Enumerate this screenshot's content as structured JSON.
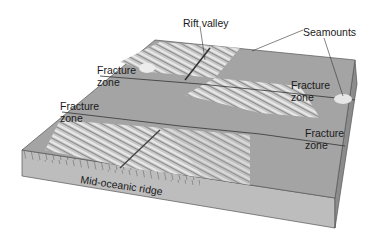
{
  "figure": {
    "type": "block-diagram",
    "colors": {
      "top_surface": "#a8a8a8",
      "ridge_texture": "#d8d8d8",
      "front_face": "#bdbdbd",
      "side_face": "#8c8c8c",
      "label_text": "#1a1a1a",
      "leader_line": "#333333"
    }
  },
  "labels": {
    "rift_valley": "Rift valley",
    "seamounts": "Seamounts",
    "fracture_zone_1_line1": "Fracture",
    "fracture_zone_1_line2": "zone",
    "fracture_zone_2_line1": "Fracture",
    "fracture_zone_2_line2": "zone",
    "fracture_zone_3_line1": "Fracture",
    "fracture_zone_3_line2": "zone",
    "fracture_zone_4_line1": "Fracture",
    "fracture_zone_4_line2": "zone",
    "mid_oceanic_ridge": "Mid-oceanic ridge"
  }
}
